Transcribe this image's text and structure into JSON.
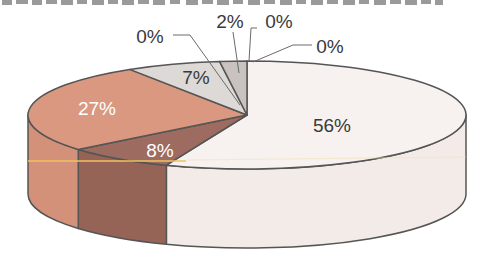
{
  "chart_data": {
    "type": "pie",
    "style": "3d-exploded-none",
    "title": "",
    "start_angle_deg": -90,
    "direction": "clockwise",
    "values": [
      56,
      8,
      27,
      7,
      2,
      0,
      0,
      0
    ],
    "labels": [
      "56%",
      "8%",
      "27%",
      "7%",
      "2%",
      "0%",
      "0%",
      "0%"
    ],
    "colors_top": [
      "#f7f1ef",
      "#9d6b5f",
      "#d9987f",
      "#dcd9d6",
      "#c9c2bf",
      "#c9c2bf",
      "#c9c2bf",
      "#c9c2bf"
    ],
    "colors_side": [
      "#f3ebe8",
      "#966457",
      "#d4917a",
      "#d3d0cd",
      "#bfb8b5",
      "#bfb8b5",
      "#bfb8b5",
      "#bfb8b5"
    ],
    "label_colors": [
      "#3a3a3a",
      "#ffffff",
      "#ffffff",
      "#3a3a3a",
      "#3a3a3a",
      "#3a3a3a",
      "#3a3a3a",
      "#3a3a3a"
    ],
    "legend": "none",
    "grid": false
  },
  "caption": {
    "note": "cropped caption text at top edge, illegible"
  },
  "colors": {
    "outline": "#555555",
    "scan_line": "#f0c060"
  }
}
